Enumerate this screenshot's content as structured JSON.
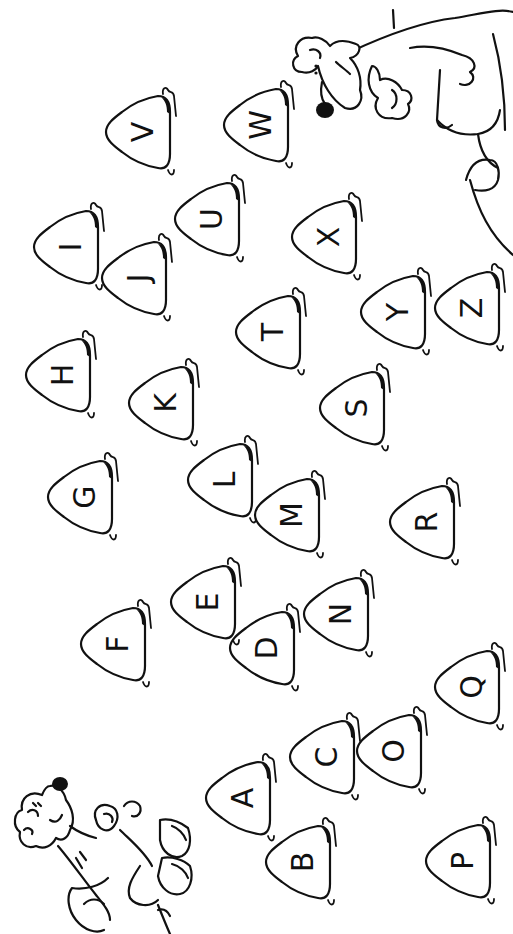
{
  "page": {
    "type": "coloring-page",
    "orientation": "rotated-90-degrees",
    "background": "#ffffff",
    "ink": "#111111"
  },
  "stones": [
    {
      "letter": "A",
      "x": 240,
      "y": 798
    },
    {
      "letter": "B",
      "x": 300,
      "y": 862
    },
    {
      "letter": "C",
      "x": 324,
      "y": 757
    },
    {
      "letter": "D",
      "x": 264,
      "y": 648
    },
    {
      "letter": "E",
      "x": 205,
      "y": 602
    },
    {
      "letter": "F",
      "x": 115,
      "y": 644
    },
    {
      "letter": "G",
      "x": 82,
      "y": 497
    },
    {
      "letter": "H",
      "x": 60,
      "y": 375
    },
    {
      "letter": "I",
      "x": 68,
      "y": 247
    },
    {
      "letter": "J",
      "x": 136,
      "y": 278
    },
    {
      "letter": "K",
      "x": 163,
      "y": 403
    },
    {
      "letter": "L",
      "x": 222,
      "y": 480
    },
    {
      "letter": "M",
      "x": 289,
      "y": 515
    },
    {
      "letter": "N",
      "x": 338,
      "y": 614
    },
    {
      "letter": "O",
      "x": 391,
      "y": 751
    },
    {
      "letter": "P",
      "x": 460,
      "y": 861
    },
    {
      "letter": "Q",
      "x": 469,
      "y": 687
    },
    {
      "letter": "R",
      "x": 424,
      "y": 522
    },
    {
      "letter": "S",
      "x": 354,
      "y": 408
    },
    {
      "letter": "T",
      "x": 270,
      "y": 332
    },
    {
      "letter": "U",
      "x": 209,
      "y": 219
    },
    {
      "letter": "V",
      "x": 140,
      "y": 132
    },
    {
      "letter": "W",
      "x": 258,
      "y": 125
    },
    {
      "letter": "X",
      "x": 326,
      "y": 237
    },
    {
      "letter": "Y",
      "x": 395,
      "y": 312
    },
    {
      "letter": "Z",
      "x": 469,
      "y": 308
    }
  ],
  "characters": [
    {
      "name": "bear",
      "position": "bottom-left"
    },
    {
      "name": "dog",
      "position": "top-right"
    }
  ]
}
